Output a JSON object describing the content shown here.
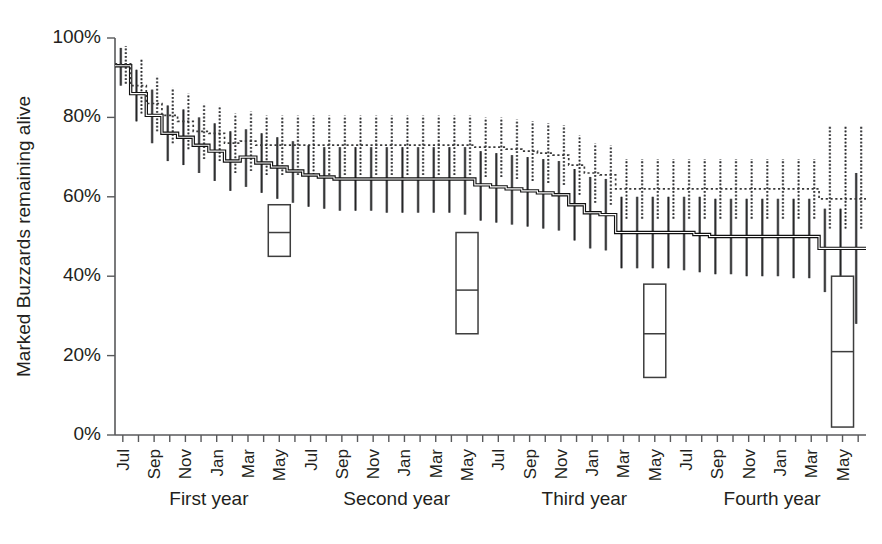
{
  "chart_data": {
    "type": "line",
    "title": "",
    "xlabel": "",
    "ylabel": "Marked Buzzards remaining alive",
    "ylim": [
      0,
      100
    ],
    "ytick_labels": [
      "0%",
      "20%",
      "40%",
      "60%",
      "80%",
      "100%"
    ],
    "ytick_values": [
      0,
      20,
      40,
      60,
      80,
      100
    ],
    "grid": false,
    "legend": "none",
    "x": [
      1,
      2,
      3,
      4,
      5,
      6,
      7,
      8,
      9,
      10,
      11,
      12,
      13,
      14,
      15,
      16,
      17,
      18,
      19,
      20,
      21,
      22,
      23,
      24,
      25,
      26,
      27,
      28,
      29,
      30,
      31,
      32,
      33,
      34,
      35,
      36,
      37,
      38,
      39,
      40,
      41,
      42,
      43,
      44,
      45,
      46,
      47,
      48
    ],
    "xtick_labels": [
      "Jul",
      "",
      "Sep",
      "",
      "Nov",
      "",
      "Jan",
      "",
      "Mar",
      "",
      "May",
      "",
      "Jul",
      "",
      "Sep",
      "",
      "Nov",
      "",
      "Jan",
      "",
      "Mar",
      "",
      "May",
      "",
      "Jul",
      "",
      "Sep",
      "",
      "Nov",
      "",
      "Jan",
      "",
      "Mar",
      "",
      "May",
      "",
      "Jul",
      "",
      "Sep",
      "",
      "Nov",
      "",
      "Jan",
      "",
      "Mar",
      "",
      "May",
      ""
    ],
    "month_labels": [
      "Jul",
      "Sep",
      "Nov",
      "Jan",
      "Mar",
      "May",
      "Jul",
      "Sep",
      "Nov",
      "Jan",
      "Mar",
      "May",
      "Jul",
      "Sep",
      "Nov",
      "Jan",
      "Mar",
      "May",
      "Jul",
      "Sep",
      "Nov",
      "Jan",
      "Mar",
      "May"
    ],
    "year_groups": [
      {
        "label": "First year",
        "start_index": 1,
        "end_index": 12
      },
      {
        "label": "Second year",
        "start_index": 13,
        "end_index": 24
      },
      {
        "label": "Third year",
        "start_index": 25,
        "end_index": 36
      },
      {
        "label": "Fourth year",
        "start_index": 37,
        "end_index": 48
      }
    ],
    "series": [
      {
        "name": "solid-survival-curve",
        "style": "solid",
        "values": [
          93.0,
          86.0,
          80.5,
          76.0,
          75.0,
          73.0,
          71.5,
          69.0,
          70.0,
          68.5,
          67.5,
          66.5,
          65.5,
          65.0,
          64.5,
          64.5,
          64.5,
          64.5,
          64.5,
          64.5,
          64.5,
          64.5,
          64.5,
          63.0,
          62.5,
          62.0,
          61.5,
          61.0,
          60.5,
          58.0,
          56.0,
          55.5,
          51.0,
          51.0,
          51.0,
          51.0,
          51.0,
          50.5,
          50.0,
          50.0,
          50.0,
          50.0,
          50.0,
          50.0,
          50.0,
          47.0,
          47.0,
          47.0
        ],
        "error_lower": [
          88.0,
          79.0,
          73.5,
          69.0,
          68.0,
          66.0,
          64.0,
          61.5,
          62.5,
          61.0,
          59.5,
          58.5,
          57.5,
          57.0,
          56.5,
          56.5,
          56.5,
          56.0,
          56.0,
          56.0,
          56.0,
          56.0,
          55.5,
          54.0,
          53.5,
          53.0,
          52.5,
          52.0,
          51.5,
          49.0,
          47.0,
          46.5,
          42.0,
          42.0,
          42.0,
          42.0,
          41.5,
          41.0,
          40.5,
          40.5,
          40.0,
          40.0,
          40.0,
          39.5,
          39.5,
          36.0,
          36.0,
          28.0
        ],
        "error_upper": [
          97.5,
          92.0,
          87.0,
          83.0,
          82.0,
          80.0,
          78.5,
          76.5,
          77.0,
          76.0,
          75.0,
          74.0,
          73.0,
          72.5,
          72.5,
          72.5,
          72.5,
          72.5,
          72.5,
          72.5,
          72.5,
          72.5,
          72.5,
          71.5,
          71.0,
          70.5,
          70.0,
          69.5,
          69.0,
          67.0,
          65.0,
          64.5,
          60.0,
          60.0,
          60.0,
          60.0,
          60.0,
          60.0,
          59.5,
          59.5,
          59.5,
          59.5,
          59.5,
          59.5,
          59.5,
          57.0,
          57.0,
          66.0
        ]
      },
      {
        "name": "dotted-survival-curve",
        "style": "dotted",
        "values": [
          93.5,
          88.0,
          83.5,
          80.5,
          79.0,
          76.5,
          76.0,
          73.5,
          74.0,
          73.0,
          73.0,
          73.0,
          73.0,
          73.0,
          73.0,
          73.0,
          73.0,
          73.0,
          73.0,
          73.0,
          73.0,
          73.0,
          73.0,
          72.5,
          72.5,
          72.0,
          71.5,
          71.0,
          70.5,
          68.0,
          66.0,
          65.5,
          62.0,
          62.0,
          62.0,
          62.0,
          62.0,
          62.0,
          62.0,
          62.0,
          62.0,
          62.0,
          62.0,
          62.0,
          62.0,
          59.5,
          59.5,
          59.5
        ],
        "error_lower": [
          88.5,
          81.0,
          76.5,
          73.5,
          72.0,
          69.5,
          69.0,
          66.0,
          66.5,
          65.5,
          65.5,
          65.5,
          65.5,
          65.5,
          65.5,
          65.5,
          65.5,
          65.5,
          65.5,
          65.5,
          65.5,
          65.5,
          65.5,
          65.0,
          65.0,
          64.5,
          64.0,
          63.5,
          63.0,
          60.5,
          58.5,
          58.0,
          54.5,
          54.5,
          54.5,
          54.5,
          54.5,
          54.5,
          54.5,
          54.5,
          54.5,
          54.5,
          54.5,
          54.5,
          54.5,
          52.0,
          52.0,
          52.0
        ],
        "error_upper": [
          98.0,
          94.5,
          90.5,
          87.5,
          86.0,
          83.5,
          83.0,
          81.0,
          81.5,
          80.5,
          80.5,
          80.5,
          80.5,
          80.5,
          80.5,
          80.5,
          80.5,
          80.5,
          80.5,
          80.5,
          80.5,
          80.5,
          80.5,
          80.0,
          80.0,
          79.5,
          79.0,
          78.5,
          78.0,
          75.5,
          73.5,
          73.0,
          69.5,
          69.5,
          69.5,
          69.5,
          69.5,
          69.5,
          69.5,
          69.5,
          69.5,
          69.5,
          69.5,
          69.5,
          69.5,
          78.0,
          78.0,
          78.0
        ]
      }
    ],
    "boxplots": [
      {
        "name": "box-first-year",
        "x_index": 11,
        "bottom": 45.0,
        "top": 58.0,
        "median": 51.0
      },
      {
        "name": "box-second-year",
        "x_index": 23,
        "bottom": 25.5,
        "top": 51.0,
        "median": 36.5
      },
      {
        "name": "box-third-year",
        "x_index": 35,
        "bottom": 14.5,
        "top": 38.0,
        "median": 25.5
      },
      {
        "name": "box-fourth-year",
        "x_index": 47,
        "bottom": 2.0,
        "top": 40.0,
        "median": 21.0
      }
    ]
  }
}
